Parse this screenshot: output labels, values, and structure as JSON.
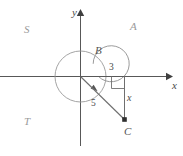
{
  "figure": {
    "kind": "coordinate-plane-diagram",
    "axes": {
      "x_label": "x",
      "y_label": "y"
    },
    "quadrant_labels": {
      "upper_left": "S",
      "upper_right": "A",
      "lower_left": "T"
    },
    "points": {
      "circle_top_label": "B",
      "terminal_point_label": "C"
    },
    "measures": {
      "horizontal_leg": "3",
      "vertical_leg": "x",
      "hypotenuse": "5"
    },
    "colors": {
      "stroke": "#4a4a4a",
      "light_stroke": "#8c8c8c",
      "faint_text": "#9a9a9a",
      "background": "#ffffff"
    }
  }
}
